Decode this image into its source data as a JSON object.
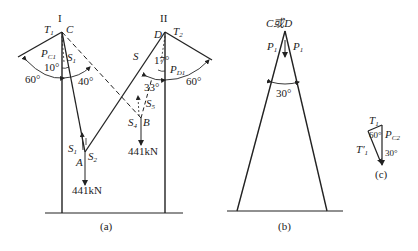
{
  "figure_a": {
    "caption": "(a)",
    "pole_left_label": "I",
    "pole_right_label": "II",
    "points": {
      "C": "C",
      "D": "D",
      "A": "A",
      "B": "B",
      "T1": "T",
      "T1_sub": "1",
      "T2": "T",
      "T2_sub": "2"
    },
    "forces": {
      "PC1": "P",
      "PC1_sub": "C1",
      "PD1": "P",
      "PD1_sub": "D1",
      "S": "S",
      "S1_top": "S",
      "S1_top_sub": "1",
      "S1": "S",
      "S1_sub": "1",
      "S2": "S",
      "S2_sub": "2",
      "S4": "S",
      "S4_sub": "4",
      "S5": "S",
      "S5_sub": "5"
    },
    "angles": {
      "left_60": "60°",
      "left_10": "10°",
      "left_40": "40°",
      "right_17": "17°",
      "right_33": "33°",
      "right_60": "60°"
    },
    "loads": {
      "A_load": "441kN",
      "B_load": "441kN"
    }
  },
  "figure_b": {
    "caption": "(b)",
    "apex_label": "C或D",
    "P1_left": "P",
    "P1_left_sub": "1",
    "P1_right": "P",
    "P1_right_sub": "1",
    "angle": "30°"
  },
  "figure_c": {
    "caption": "(c)",
    "T1": "T",
    "T1_sub": "1",
    "T1_prime": "T",
    "T1_prime_sub": "1",
    "T1_prime_mark": "′",
    "PC2": "P",
    "PC2_sub": "C2",
    "angle_60": "60°",
    "angle_30": "30°"
  }
}
